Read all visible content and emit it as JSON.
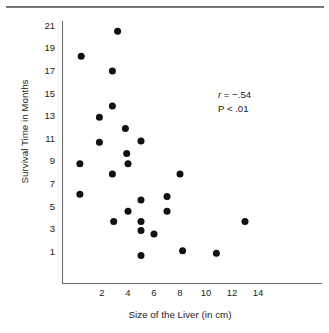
{
  "chart_data": {
    "type": "scatter",
    "title": "",
    "xlabel": "Size of the Liver (in cm)",
    "ylabel": "Survival Time in Months",
    "xlim": [
      0,
      15.2
    ],
    "ylim": [
      0,
      21.8
    ],
    "xticks": [
      2,
      4,
      6,
      8,
      10,
      12,
      14
    ],
    "yticks": [
      1,
      3,
      5,
      7,
      9,
      11,
      13,
      15,
      17,
      19,
      21
    ],
    "grid": false,
    "legend": null,
    "marker": "filled-circle",
    "marker_color": "#111111",
    "points": [
      {
        "x": 0.4,
        "y": 18.3
      },
      {
        "x": 0.3,
        "y": 8.8
      },
      {
        "x": 0.3,
        "y": 6.1
      },
      {
        "x": 1.8,
        "y": 12.9
      },
      {
        "x": 1.8,
        "y": 10.7
      },
      {
        "x": 2.8,
        "y": 17.0
      },
      {
        "x": 2.8,
        "y": 13.9
      },
      {
        "x": 2.8,
        "y": 7.9
      },
      {
        "x": 2.9,
        "y": 3.7
      },
      {
        "x": 3.2,
        "y": 20.5
      },
      {
        "x": 3.8,
        "y": 11.9
      },
      {
        "x": 3.9,
        "y": 9.7
      },
      {
        "x": 4.0,
        "y": 8.8
      },
      {
        "x": 4.0,
        "y": 4.6
      },
      {
        "x": 5.0,
        "y": 10.8
      },
      {
        "x": 5.0,
        "y": 5.6
      },
      {
        "x": 5.0,
        "y": 3.7
      },
      {
        "x": 5.0,
        "y": 2.9
      },
      {
        "x": 5.0,
        "y": 0.7
      },
      {
        "x": 6.0,
        "y": 2.6
      },
      {
        "x": 7.0,
        "y": 5.9
      },
      {
        "x": 7.0,
        "y": 4.6
      },
      {
        "x": 8.0,
        "y": 7.9
      },
      {
        "x": 8.2,
        "y": 1.1
      },
      {
        "x": 10.8,
        "y": 0.9
      },
      {
        "x": 13.0,
        "y": 3.7
      }
    ],
    "annotations": [
      {
        "name": "correlation",
        "symbol": "r",
        "text": " = −.54"
      },
      {
        "name": "p-value",
        "text": "P < .01"
      }
    ]
  },
  "axes": {
    "y_tick_labels": [
      "21",
      "19",
      "17",
      "15",
      "13",
      "11",
      "9",
      "7",
      "5",
      "3",
      "1"
    ],
    "x_tick_labels": [
      "2",
      "4",
      "6",
      "8",
      "10",
      "12",
      "14"
    ],
    "y_axis_title": "Survival Time in Months",
    "x_axis_title": "Size of the Liver (in cm)"
  },
  "stats": {
    "r_symbol": "r",
    "r_value": " = −.54",
    "p_value": "P < .01"
  }
}
